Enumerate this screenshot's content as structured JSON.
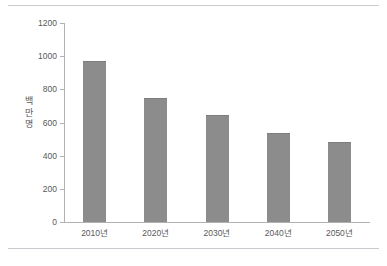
{
  "chart_data": {
    "type": "bar",
    "title": "",
    "xlabel": "",
    "ylabel": "백만명",
    "ylabel_chars": [
      "백",
      "만",
      "명"
    ],
    "categories": [
      "2010년",
      "2020년",
      "2030년",
      "2040년",
      "2050년"
    ],
    "values": [
      970,
      750,
      645,
      535,
      480
    ],
    "ylim": [
      0,
      1200
    ],
    "yticks": [
      0,
      200,
      400,
      600,
      800,
      1000,
      1200
    ],
    "ytick_labels": [
      "0",
      "200",
      "400",
      "600",
      "800",
      "1000",
      "1200"
    ],
    "grid": false,
    "legend": null,
    "bar_color": "#8c8c8c",
    "axis_color": "#b2b2b2",
    "text_color": "#58585a",
    "rule_color": "#c9c9cf",
    "background": "#ffffff"
  }
}
